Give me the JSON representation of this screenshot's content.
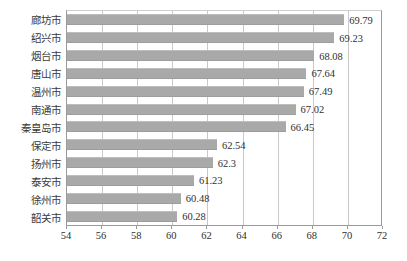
{
  "chart_data": {
    "type": "bar",
    "orientation": "horizontal",
    "title": "",
    "subtitle": "",
    "xlabel": "",
    "ylabel": "",
    "xlim": [
      54,
      72
    ],
    "xticks": [
      54,
      56,
      58,
      60,
      62,
      64,
      66,
      68,
      70,
      72
    ],
    "grid": true,
    "legend": false,
    "legend_position": "none",
    "bar_color": "#a9a9a9",
    "categories": [
      "廊坊市",
      "绍兴市",
      "烟台市",
      "唐山市",
      "温州市",
      "南通市",
      "秦皇岛市",
      "保定市",
      "扬州市",
      "泰安市",
      "徐州市",
      "韶关市"
    ],
    "values": [
      69.79,
      69.23,
      68.08,
      67.64,
      67.49,
      67.02,
      66.45,
      62.54,
      62.3,
      61.23,
      60.48,
      60.28
    ],
    "data_labels": [
      "69.79",
      "69.23",
      "68.08",
      "67.64",
      "67.49",
      "67.02",
      "66.45",
      "62.54",
      "62.3",
      "61.23",
      "60.48",
      "60.28"
    ]
  }
}
